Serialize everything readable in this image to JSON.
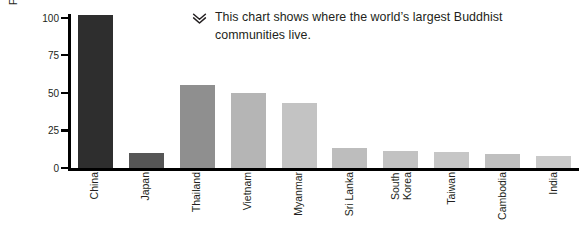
{
  "chart_data": {
    "type": "bar",
    "title": "",
    "xlabel": "",
    "ylabel": "People (millions)",
    "categories": [
      "China",
      "Japan",
      "Thailand",
      "Vietnam",
      "Myanmar",
      "Sri Lanka",
      "South Korea",
      "Taiwan",
      "Cambodia",
      "India"
    ],
    "values": [
      102,
      10,
      55,
      50,
      43,
      13,
      11,
      10.5,
      9.5,
      8
    ],
    "ylim": [
      0,
      105
    ],
    "yticks": [
      0,
      25,
      50,
      75,
      100
    ],
    "ytick_labels": [
      "0",
      "25",
      "50",
      "75",
      "100"
    ],
    "grid": false,
    "legend": null,
    "bar_colors": [
      "#2e2e2e",
      "#565656",
      "#8f8f8f",
      "#b5b5b5",
      "#c3c3c3",
      "#bdbdbd",
      "#c2c2c2",
      "#c6c6c6",
      "#bfbfbf",
      "#c9c9c9"
    ],
    "annotations": [
      {
        "icon": "double-chevron-down-icon",
        "text": "This chart shows where the world’s largest Buddhist communities live."
      }
    ]
  },
  "axes": {
    "y_title": "People (millions)",
    "axis_color": "#000000"
  },
  "colors": {
    "background": "#ffffff",
    "text": "#231f20",
    "axis": "#000000"
  }
}
